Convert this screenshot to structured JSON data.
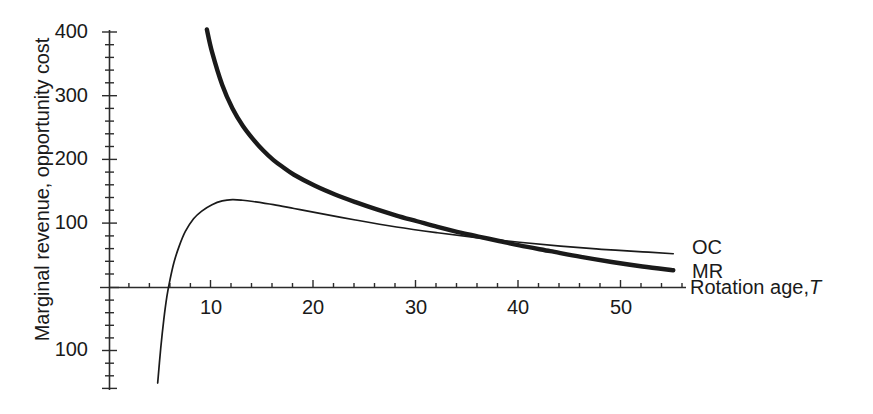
{
  "chart_data": {
    "type": "line",
    "title": "",
    "xlabel": "Rotation age, T",
    "ylabel": "Marginal revenue, opportunity cost",
    "xlim": [
      0,
      55
    ],
    "ylim": [
      -140,
      430
    ],
    "grid": false,
    "legend_position": "right-inline",
    "x_ticks": [
      10,
      20,
      30,
      40,
      50
    ],
    "x_tick_labels": [
      "10",
      "20",
      "30",
      "40",
      "50"
    ],
    "x_minor_tick_step": 2,
    "y_ticks": [
      400,
      300,
      200,
      100,
      0,
      -100
    ],
    "y_tick_labels": [
      "400",
      "300",
      "200",
      "100",
      "",
      "100"
    ],
    "y_minor_tick_step": 20,
    "series": [
      {
        "name": "OC",
        "label": "OC",
        "style": "thick",
        "description": "Opportunity cost: declining convex curve from high values at low rotation age",
        "points": [
          [
            9.5,
            405
          ],
          [
            10,
            370
          ],
          [
            11,
            318
          ],
          [
            12,
            281
          ],
          [
            13,
            254
          ],
          [
            14,
            233
          ],
          [
            15,
            215
          ],
          [
            16,
            200
          ],
          [
            17,
            188
          ],
          [
            18,
            177
          ],
          [
            20,
            160
          ],
          [
            22,
            146
          ],
          [
            24,
            134
          ],
          [
            26,
            123
          ],
          [
            28,
            113
          ],
          [
            30,
            104
          ],
          [
            32,
            95
          ],
          [
            34,
            87
          ],
          [
            36,
            80
          ],
          [
            38,
            73
          ],
          [
            40,
            66
          ],
          [
            43,
            57
          ],
          [
            46,
            48
          ],
          [
            49,
            40
          ],
          [
            52,
            33
          ],
          [
            55,
            27
          ]
        ]
      },
      {
        "name": "MR",
        "label": "MR",
        "style": "thin",
        "description": "Marginal revenue: rises steeply from deeply negative, peaks near age 12, then declines slowly",
        "points": [
          [
            4.7,
            -150
          ],
          [
            5.0,
            -95
          ],
          [
            5.3,
            -50
          ],
          [
            5.6,
            -14
          ],
          [
            5.9,
            12
          ],
          [
            6.3,
            40
          ],
          [
            6.8,
            65
          ],
          [
            7.4,
            88
          ],
          [
            8.2,
            108
          ],
          [
            9.0,
            120
          ],
          [
            10.0,
            130
          ],
          [
            11.0,
            136
          ],
          [
            12.0,
            138
          ],
          [
            13.0,
            137
          ],
          [
            14.0,
            135
          ],
          [
            16.0,
            130
          ],
          [
            18.0,
            124
          ],
          [
            20.0,
            118
          ],
          [
            24.0,
            106
          ],
          [
            28.0,
            95
          ],
          [
            32.0,
            86
          ],
          [
            36.0,
            78
          ],
          [
            40.0,
            71
          ],
          [
            44.0,
            65
          ],
          [
            48.0,
            60
          ],
          [
            52.0,
            56
          ],
          [
            55.0,
            53
          ]
        ]
      }
    ],
    "annotations": [
      {
        "text": "OC",
        "series": "OC",
        "x": 56,
        "y": 60
      },
      {
        "text": "MR",
        "series": "MR",
        "x": 56,
        "y": 26
      }
    ]
  },
  "labels": {
    "y_axis_title": "Marginal revenue, opportunity cost",
    "x_axis_title_text": "Rotation age,",
    "x_axis_title_var": "T",
    "oc_label": "OC",
    "mr_label": "MR",
    "y_400": "400",
    "y_300": "300",
    "y_200": "200",
    "y_100": "100",
    "y_neg100": "100",
    "x_10": "10",
    "x_20": "20",
    "x_30": "30",
    "x_40": "40",
    "x_50": "50"
  },
  "colors": {
    "axis": "#2b2b2b",
    "curve": "#1a1a1a",
    "background": "#ffffff"
  }
}
